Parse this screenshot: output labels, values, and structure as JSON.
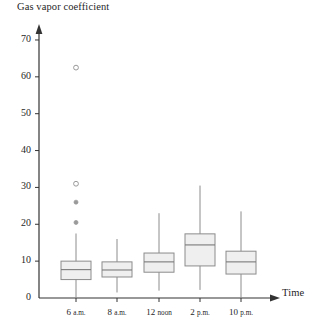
{
  "chart_data": {
    "type": "box",
    "title": "",
    "ylabel": "Gas vapor coefficient",
    "xlabel": "Time",
    "categories": [
      "6 a.m.",
      "8 a.m.",
      "12 noon",
      "2 p.m.",
      "10 p.m."
    ],
    "category_parts": [
      {
        "num": "6",
        "unit": "a.m."
      },
      {
        "num": "8",
        "unit": "a.m."
      },
      {
        "num": "12",
        "unit": "noon"
      },
      {
        "num": "2",
        "unit": "p.m."
      },
      {
        "num": "10",
        "unit": "p.m."
      }
    ],
    "ylim": [
      0,
      75
    ],
    "yticks": [
      0,
      10,
      20,
      30,
      40,
      50,
      60,
      70
    ],
    "ytick_labels": [
      "0",
      "10",
      "20",
      "30",
      "40",
      "50",
      "60",
      "70"
    ],
    "grid": false,
    "legend": "none",
    "boxes": [
      {
        "category": "6 a.m.",
        "whisker_low": 0.0,
        "q1": 5.0,
        "median": 7.7,
        "q3": 10.0,
        "whisker_high": 17.5,
        "outliers": [
          {
            "value": 62.5,
            "style": "open"
          },
          {
            "value": 31.0,
            "style": "open"
          },
          {
            "value": 26.0,
            "style": "filled"
          },
          {
            "value": 20.5,
            "style": "filled"
          }
        ]
      },
      {
        "category": "8 a.m.",
        "whisker_low": 1.5,
        "q1": 5.7,
        "median": 7.6,
        "q3": 9.8,
        "whisker_high": 16.0,
        "outliers": []
      },
      {
        "category": "12 noon",
        "whisker_low": 2.0,
        "q1": 7.0,
        "median": 9.8,
        "q3": 12.2,
        "whisker_high": 23.0,
        "outliers": []
      },
      {
        "category": "2 p.m.",
        "whisker_low": 2.2,
        "q1": 8.7,
        "median": 14.4,
        "q3": 17.4,
        "whisker_high": 30.5,
        "outliers": []
      },
      {
        "category": "10 p.m.",
        "whisker_low": 0.0,
        "q1": 6.5,
        "median": 9.8,
        "q3": 12.7,
        "whisker_high": 23.5,
        "outliers": []
      }
    ],
    "colors": {
      "axis": "#333333",
      "box_fill": "#efefef",
      "box_stroke": "#8c8c8c",
      "whisker": "#8c8c8c",
      "median": "#7a7a7a",
      "outlier_stroke": "#9a9a9a",
      "outlier_fill": "#9a9a9a",
      "text": "#1f1f1f"
    },
    "geometry": {
      "y_zero_px": 298,
      "px_per_unit": 3.686,
      "axis_x_px": 39,
      "box_half_width_px": 15,
      "centers_px": [
        76,
        117,
        159,
        200,
        241
      ]
    }
  }
}
